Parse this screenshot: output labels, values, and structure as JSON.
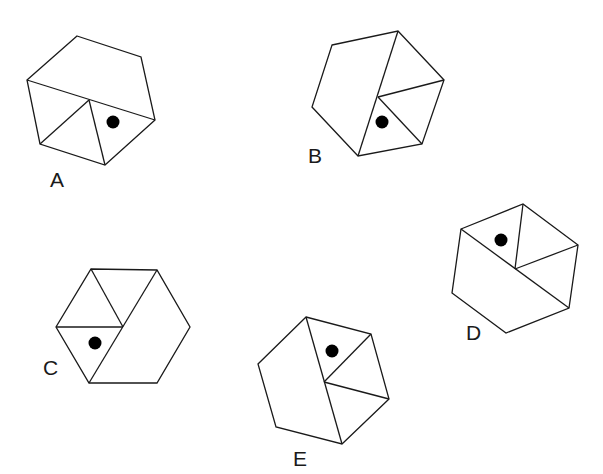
{
  "diagram": {
    "dot_color": "#000000",
    "line_color": "#1a1a1a",
    "hexagons": [
      {
        "label": "A",
        "label_pos": [
          50,
          187
        ],
        "vertices": [
          [
            77,
            36
          ],
          [
            141,
            57
          ],
          [
            155,
            120
          ],
          [
            105,
            165
          ],
          [
            40,
            144
          ],
          [
            27,
            80
          ]
        ],
        "center": [
          89,
          100
        ],
        "lines": [
          [
            [
              27,
              80
            ],
            [
              155,
              120
            ]
          ],
          [
            [
              89,
              100
            ],
            [
              40,
              144
            ]
          ],
          [
            [
              89,
              100
            ],
            [
              105,
              165
            ]
          ]
        ],
        "dot": [
          113,
          122
        ]
      },
      {
        "label": "B",
        "label_pos": [
          308,
          163
        ],
        "vertices": [
          [
            332,
            45
          ],
          [
            398,
            31
          ],
          [
            444,
            80
          ],
          [
            422,
            144
          ],
          [
            358,
            156
          ],
          [
            312,
            107
          ]
        ],
        "center": [
          378,
          97
        ],
        "lines": [
          [
            [
              398,
              31
            ],
            [
              358,
              156
            ]
          ],
          [
            [
              378,
              97
            ],
            [
              444,
              80
            ]
          ],
          [
            [
              378,
              97
            ],
            [
              422,
              144
            ]
          ]
        ],
        "dot": [
          382,
          122
        ]
      },
      {
        "label": "C",
        "label_pos": [
          43,
          375
        ],
        "vertices": [
          [
            91,
            269
          ],
          [
            157,
            270
          ],
          [
            190,
            327
          ],
          [
            157,
            383
          ],
          [
            89,
            383
          ],
          [
            56,
            327
          ]
        ],
        "center": [
          123,
          327
        ],
        "lines": [
          [
            [
              157,
              270
            ],
            [
              89,
              383
            ]
          ],
          [
            [
              123,
              327
            ],
            [
              91,
              269
            ]
          ],
          [
            [
              123,
              327
            ],
            [
              56,
              327
            ]
          ]
        ],
        "dot": [
          95,
          343
        ]
      },
      {
        "label": "D",
        "label_pos": [
          466,
          340
        ],
        "vertices": [
          [
            461,
            229
          ],
          [
            523,
            204
          ],
          [
            578,
            245
          ],
          [
            569,
            308
          ],
          [
            506,
            333
          ],
          [
            452,
            293
          ]
        ],
        "center": [
          515,
          269
        ],
        "lines": [
          [
            [
              461,
              229
            ],
            [
              569,
              308
            ]
          ],
          [
            [
              515,
              269
            ],
            [
              523,
              204
            ]
          ],
          [
            [
              515,
              269
            ],
            [
              578,
              245
            ]
          ]
        ],
        "dot": [
          501,
          240
        ]
      },
      {
        "label": "E",
        "label_pos": [
          293,
          466
        ],
        "vertices": [
          [
            306,
            317
          ],
          [
            371,
            334
          ],
          [
            389,
            399
          ],
          [
            342,
            444
          ],
          [
            276,
            427
          ],
          [
            258,
            364
          ]
        ],
        "center": [
          324,
          382
        ],
        "lines": [
          [
            [
              306,
              317
            ],
            [
              342,
              444
            ]
          ],
          [
            [
              324,
              382
            ],
            [
              371,
              334
            ]
          ],
          [
            [
              324,
              382
            ],
            [
              389,
              399
            ]
          ]
        ],
        "dot": [
          332,
          351
        ]
      }
    ]
  }
}
